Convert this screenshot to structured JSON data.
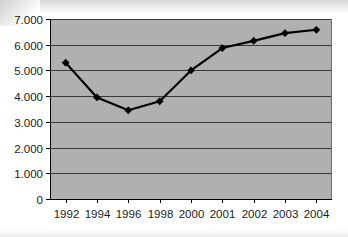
{
  "chart_data": {
    "type": "line",
    "title": "",
    "subtitle": "",
    "xlabel": "",
    "ylabel": "",
    "categories": [
      "1992",
      "1994",
      "1996",
      "1998",
      "2000",
      "2001",
      "2002",
      "2003",
      "2004"
    ],
    "series": [
      {
        "name": "",
        "values": [
          5300,
          3950,
          3450,
          3800,
          5000,
          5870,
          6150,
          6450,
          6580
        ]
      }
    ],
    "y_tick_labels": [
      "7.000",
      "6.000",
      "5.000",
      "4.000",
      "3.000",
      "2.000",
      "1.000",
      "0"
    ],
    "y_tick_values": [
      7000,
      6000,
      5000,
      4000,
      3000,
      2000,
      1000,
      0
    ],
    "x_tick_labels": [
      "1992",
      "1994",
      "1996",
      "1998",
      "2000",
      "2001",
      "2002",
      "2003",
      "2004"
    ],
    "ylim": [
      0,
      7000
    ],
    "grid": "horizontal",
    "legend": "none",
    "marker": "diamond",
    "colors": {
      "line": "#000000",
      "marker": "#000000",
      "plot_background": "#b0b0b0",
      "gridline": "#3a3a3a",
      "axis": "#000000",
      "page_background": "#ffffff",
      "tick_label": "#1a1a1a"
    }
  }
}
